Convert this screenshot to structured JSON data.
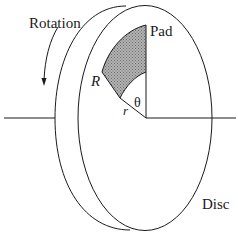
{
  "diagram": {
    "type": "disc-brake-pad-schematic",
    "labels": {
      "rotation": "Rotation",
      "pad": "Pad",
      "outer_radius": "R",
      "inner_radius": "r",
      "angle": "θ",
      "disc": "Disc"
    },
    "elements": [
      "disc (rear face)",
      "disc (front face)",
      "rotation axis",
      "shaded annular-sector pad",
      "rotation direction arrow",
      "angle θ between vertical and pad edge"
    ],
    "colors": {
      "line": "#1a1a1a",
      "pad_fill": "#9a9a9a",
      "background": "#ffffff"
    }
  }
}
